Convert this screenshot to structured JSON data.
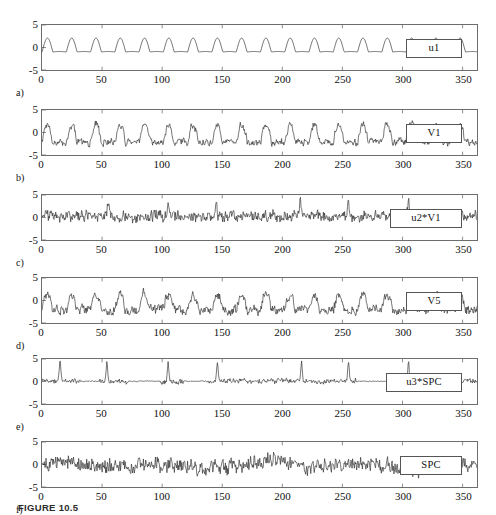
{
  "figure": {
    "caption": "FIGURE 10.5",
    "x_ticks": [
      0,
      50,
      100,
      150,
      200,
      250,
      300,
      350
    ],
    "y_ticks": [
      "5",
      "0",
      "-5"
    ],
    "xlim": [
      0,
      362
    ],
    "ylim": [
      -5,
      5
    ]
  },
  "chart_data": [
    {
      "type": "line",
      "panel": "a",
      "panel_label": "a)",
      "legend": "u1",
      "title": "",
      "xlabel": "",
      "ylabel": "",
      "xlim": [
        0,
        362
      ],
      "ylim": [
        -5,
        5
      ],
      "xticks": [
        0,
        50,
        100,
        150,
        200,
        250,
        300,
        350
      ],
      "yticks": [
        -5,
        0,
        5
      ],
      "grid": false,
      "legend_position": "inside-right",
      "description": "Smooth periodic oscillation, period about 20, peaks near +2, troughs near -1",
      "series": [
        {
          "name": "u1",
          "kind": "periodic-pulse",
          "period": 20.2,
          "peak": 2.1,
          "trough": -1.0,
          "noise": 0.0
        }
      ]
    },
    {
      "type": "line",
      "panel": "b",
      "panel_label": "b)",
      "legend": "V1",
      "title": "",
      "xlabel": "",
      "ylabel": "",
      "xlim": [
        0,
        362
      ],
      "ylim": [
        -5,
        5
      ],
      "xticks": [
        0,
        50,
        100,
        150,
        200,
        250,
        300,
        350
      ],
      "yticks": [
        -5,
        0,
        5
      ],
      "grid": false,
      "legend_position": "inside-right",
      "description": "Noisy periodic signal following u1 shape, amplitude roughly -3 to +2.5",
      "series": [
        {
          "name": "V1",
          "kind": "periodic-pulse-noisy",
          "period": 20.2,
          "peak": 1.9,
          "trough": -2.2,
          "noise": 0.55
        }
      ]
    },
    {
      "type": "line",
      "panel": "c",
      "panel_label": "c)",
      "legend": "u2*V1",
      "title": "",
      "xlabel": "",
      "ylabel": "",
      "xlim": [
        0,
        362
      ],
      "ylim": [
        -5,
        5
      ],
      "xticks": [
        0,
        50,
        100,
        150,
        200,
        250,
        300,
        350
      ],
      "yticks": [
        -5,
        0,
        5
      ],
      "grid": false,
      "legend_position": "inside-right",
      "description": "Dense high-frequency noise centered near 0 with occasional positive spikes up to about +3.5 near x=55, 105, 215, 305",
      "series": [
        {
          "name": "u2*V1",
          "kind": "dense-noise-spiky",
          "baseline": 0.3,
          "noise": 0.7,
          "spike_positions": [
            55,
            105,
            145,
            215,
            255,
            305
          ],
          "spike_height": 3.4
        }
      ]
    },
    {
      "type": "line",
      "panel": "d",
      "panel_label": "d)",
      "legend": "V5",
      "title": "",
      "xlabel": "",
      "ylabel": "",
      "xlim": [
        0,
        362
      ],
      "ylim": [
        -5,
        5
      ],
      "xticks": [
        0,
        50,
        100,
        150,
        200,
        250,
        300,
        350
      ],
      "yticks": [
        -5,
        0,
        5
      ],
      "grid": false,
      "legend_position": "inside-right",
      "description": "Noisy fluctuating signal with slow modulation, amplitude roughly -3 to +2",
      "series": [
        {
          "name": "V5",
          "kind": "modulated-noise",
          "period": 20.2,
          "peak": 1.7,
          "trough": -2.6,
          "noise": 0.65
        }
      ]
    },
    {
      "type": "line",
      "panel": "e",
      "panel_label": "e)",
      "legend": "u3*SPC",
      "title": "",
      "xlabel": "",
      "ylabel": "",
      "xlim": [
        0,
        362
      ],
      "ylim": [
        -5,
        5
      ],
      "xticks": [
        0,
        50,
        100,
        150,
        200,
        250,
        300,
        350
      ],
      "yticks": [
        -5,
        0,
        5
      ],
      "grid": false,
      "legend_position": "inside-right",
      "description": "Intermittent signal: quiet near-flat stretches interrupted by tall sharp spikes reaching about +4.5 at x=15, 55, 105, 145, 215, 255, 305",
      "series": [
        {
          "name": "u3*SPC",
          "kind": "intermittent-spikes",
          "baseline": 0.05,
          "noise": 0.35,
          "spike_positions": [
            15,
            54,
            105,
            146,
            216,
            255,
            305
          ],
          "spike_height": 4.4,
          "quiet_windows": [
            [
              32,
              48
            ],
            [
              72,
              98
            ],
            [
              118,
              138
            ],
            [
              262,
              292
            ]
          ]
        }
      ]
    },
    {
      "type": "line",
      "panel": "f",
      "panel_label": "f)",
      "legend": "SPC",
      "title": "",
      "xlabel": "",
      "ylabel": "",
      "xlim": [
        0,
        362
      ],
      "ylim": [
        -5,
        5
      ],
      "xticks": [
        0,
        50,
        100,
        150,
        200,
        250,
        300,
        350
      ],
      "yticks": [
        -5,
        0,
        5
      ],
      "grid": false,
      "legend_position": "inside-right",
      "description": "Continuous broadband noise signal, amplitude roughly -3.5 to +2.5",
      "series": [
        {
          "name": "SPC",
          "kind": "broadband-noise",
          "baseline": -0.1,
          "noise": 0.95,
          "peak": 2.4,
          "trough": -3.4
        }
      ]
    }
  ]
}
